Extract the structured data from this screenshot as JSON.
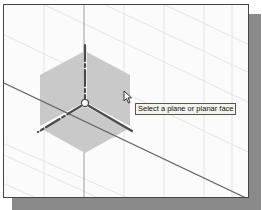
{
  "viewport": {
    "tooltip_text": "Select a plane or planar face",
    "colors": {
      "background": "#fbfbfb",
      "grid": "#e2e2e2",
      "plane_fill": "#c8c8c8",
      "axis": "#555555",
      "frame": "#444444",
      "shadow": "#8a8a8a"
    }
  },
  "icons": {
    "cursor": "arrow-cursor-icon",
    "triad": "coordinate-triad-icon"
  }
}
